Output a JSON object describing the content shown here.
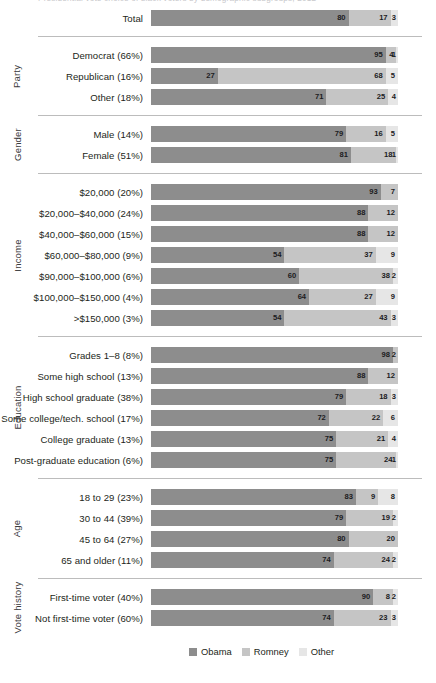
{
  "headline": "Presidential vote choice of black voters by demographic subgroups, 2012",
  "colors": {
    "obama": "#8d8d8d",
    "romney": "#c5c5c5",
    "other": "#e6e6e6",
    "track": "#eeeeef",
    "divider": "#bcbcbc",
    "text": "#231f20"
  },
  "legend": [
    {
      "label": "Obama",
      "color": "#8d8d8d"
    },
    {
      "label": "Romney",
      "color": "#c5c5c5"
    },
    {
      "label": "Other",
      "color": "#e6e6e6"
    }
  ],
  "chart_data": {
    "type": "bar",
    "subtype": "stacked-horizontal-100pct",
    "title": "Presidential vote choice of black voters by demographic subgroups, 2012",
    "xlabel": "",
    "ylabel": "",
    "xlim": [
      0,
      100
    ],
    "grid": false,
    "legend_position": "bottom",
    "series": [
      {
        "name": "Obama",
        "color": "#8d8d8d"
      },
      {
        "name": "Romney",
        "color": "#c5c5c5"
      },
      {
        "name": "Other",
        "color": "#e6e6e6"
      }
    ],
    "groups": [
      {
        "name": "",
        "rows": [
          {
            "label": "Total",
            "values": [
              80,
              17,
              3
            ]
          }
        ]
      },
      {
        "name": "Party",
        "rows": [
          {
            "label": "Democrat (66%)",
            "values": [
              95,
              4,
              1
            ]
          },
          {
            "label": "Republican (16%)",
            "values": [
              27,
              68,
              5
            ]
          },
          {
            "label": "Other (18%)",
            "values": [
              71,
              25,
              4
            ]
          }
        ]
      },
      {
        "name": "Gender",
        "rows": [
          {
            "label": "Male (14%)",
            "values": [
              79,
              16,
              5
            ]
          },
          {
            "label": "Female (51%)",
            "values": [
              81,
              18,
              1
            ]
          }
        ]
      },
      {
        "name": "Income",
        "rows": [
          {
            "label": "$20,000 (20%)",
            "values": [
              93,
              7,
              0
            ]
          },
          {
            "label": "$20,000–$40,000 (24%)",
            "values": [
              88,
              12,
              0
            ]
          },
          {
            "label": "$40,000–$60,000 (15%)",
            "values": [
              88,
              12,
              0
            ]
          },
          {
            "label": "$60,000–$80,000 (9%)",
            "values": [
              54,
              37,
              9
            ]
          },
          {
            "label": "$90,000–$100,000 (6%)",
            "values": [
              60,
              38,
              2
            ]
          },
          {
            "label": "$100,000–$150,000 (4%)",
            "values": [
              64,
              27,
              9
            ]
          },
          {
            "label": ">$150,000 (3%)",
            "values": [
              54,
              43,
              3
            ]
          }
        ]
      },
      {
        "name": "Education",
        "rows": [
          {
            "label": "Grades 1–8 (8%)",
            "values": [
              98,
              2,
              0
            ]
          },
          {
            "label": "Some high school (13%)",
            "values": [
              88,
              12,
              0
            ]
          },
          {
            "label": "High school graduate (38%)",
            "values": [
              79,
              18,
              3
            ]
          },
          {
            "label": "Some college/tech. school (17%)",
            "values": [
              72,
              22,
              6
            ]
          },
          {
            "label": "College graduate (13%)",
            "values": [
              75,
              21,
              4
            ]
          },
          {
            "label": "Post-graduate education (6%)",
            "values": [
              75,
              24,
              1
            ]
          }
        ]
      },
      {
        "name": "Age",
        "rows": [
          {
            "label": "18 to 29 (23%)",
            "values": [
              83,
              9,
              8
            ]
          },
          {
            "label": "30 to 44 (39%)",
            "values": [
              79,
              19,
              2
            ]
          },
          {
            "label": "45 to 64 (27%)",
            "values": [
              80,
              20,
              0
            ]
          },
          {
            "label": "65 and older (11%)",
            "values": [
              74,
              24,
              2
            ]
          }
        ]
      },
      {
        "name": "Vote history",
        "rows": [
          {
            "label": "First-time voter (40%)",
            "values": [
              90,
              8,
              2
            ]
          },
          {
            "label": "Not first-time voter (60%)",
            "values": [
              74,
              23,
              3
            ]
          }
        ]
      }
    ]
  }
}
